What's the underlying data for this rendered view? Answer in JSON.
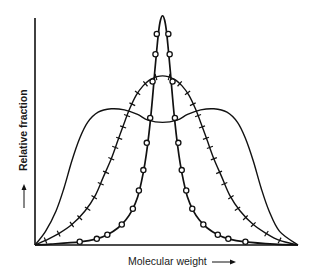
{
  "chart_data": {
    "type": "line",
    "title": "",
    "xlabel": "Molecular weight",
    "ylabel": "Relative fraction",
    "xlabel_arrow": "right-arrow",
    "ylabel_arrow": "up-arrow",
    "xlim": [
      0,
      1
    ],
    "ylim": [
      0,
      1.03
    ],
    "grid": false,
    "ticks": "none",
    "legend": "none",
    "series": [
      {
        "name": "narrow distribution",
        "marker": "circle",
        "points": [
          [
            0,
            0
          ],
          [
            0.06,
            0.004
          ],
          [
            0.17,
            0.014
          ],
          [
            0.235,
            0.027
          ],
          [
            0.275,
            0.045
          ],
          [
            0.315,
            0.075
          ],
          [
            0.345,
            0.11
          ],
          [
            0.37,
            0.155
          ],
          [
            0.39,
            0.21
          ],
          [
            0.405,
            0.28
          ],
          [
            0.418,
            0.36
          ],
          [
            0.428,
            0.44
          ],
          [
            0.438,
            0.54
          ],
          [
            0.447,
            0.65
          ],
          [
            0.455,
            0.76
          ],
          [
            0.463,
            0.86
          ],
          [
            0.47,
            0.94
          ],
          [
            0.477,
            0.99
          ],
          [
            0.485,
            1.01
          ],
          [
            0.493,
            0.99
          ],
          [
            0.5,
            0.94
          ],
          [
            0.507,
            0.86
          ],
          [
            0.515,
            0.76
          ],
          [
            0.523,
            0.65
          ],
          [
            0.532,
            0.54
          ],
          [
            0.542,
            0.44
          ],
          [
            0.552,
            0.36
          ],
          [
            0.565,
            0.28
          ],
          [
            0.58,
            0.21
          ],
          [
            0.6,
            0.155
          ],
          [
            0.625,
            0.11
          ],
          [
            0.655,
            0.075
          ],
          [
            0.695,
            0.045
          ],
          [
            0.735,
            0.027
          ],
          [
            0.8,
            0.014
          ],
          [
            0.91,
            0.004
          ],
          [
            1,
            0
          ]
        ],
        "marker_points": [
          [
            0.17,
            0.014
          ],
          [
            0.235,
            0.027
          ],
          [
            0.275,
            0.045
          ],
          [
            0.33,
            0.09
          ],
          [
            0.372,
            0.16
          ],
          [
            0.395,
            0.24
          ],
          [
            0.412,
            0.33
          ],
          [
            0.425,
            0.45
          ],
          [
            0.438,
            0.56
          ],
          [
            0.447,
            0.72
          ],
          [
            0.458,
            0.84
          ],
          [
            0.463,
            0.93
          ],
          [
            0.507,
            0.93
          ],
          [
            0.512,
            0.84
          ],
          [
            0.523,
            0.72
          ],
          [
            0.532,
            0.56
          ],
          [
            0.545,
            0.45
          ],
          [
            0.558,
            0.33
          ],
          [
            0.575,
            0.24
          ],
          [
            0.598,
            0.16
          ],
          [
            0.64,
            0.09
          ],
          [
            0.695,
            0.045
          ],
          [
            0.735,
            0.027
          ],
          [
            0.8,
            0.014
          ]
        ]
      },
      {
        "name": "intermediate distribution",
        "marker": "cross-tick",
        "points": [
          [
            0,
            0
          ],
          [
            0.04,
            0.02
          ],
          [
            0.09,
            0.05
          ],
          [
            0.14,
            0.09
          ],
          [
            0.19,
            0.15
          ],
          [
            0.23,
            0.22
          ],
          [
            0.26,
            0.3
          ],
          [
            0.29,
            0.38
          ],
          [
            0.315,
            0.46
          ],
          [
            0.34,
            0.54
          ],
          [
            0.36,
            0.6
          ],
          [
            0.385,
            0.66
          ],
          [
            0.41,
            0.7
          ],
          [
            0.44,
            0.73
          ],
          [
            0.485,
            0.745
          ],
          [
            0.53,
            0.73
          ],
          [
            0.56,
            0.7
          ],
          [
            0.585,
            0.66
          ],
          [
            0.61,
            0.6
          ],
          [
            0.63,
            0.54
          ],
          [
            0.655,
            0.46
          ],
          [
            0.68,
            0.38
          ],
          [
            0.71,
            0.3
          ],
          [
            0.74,
            0.22
          ],
          [
            0.78,
            0.15
          ],
          [
            0.83,
            0.09
          ],
          [
            0.88,
            0.05
          ],
          [
            0.93,
            0.02
          ],
          [
            1,
            0
          ]
        ],
        "marker_points": [
          [
            0.04,
            0.02
          ],
          [
            0.09,
            0.05
          ],
          [
            0.14,
            0.09
          ],
          [
            0.17,
            0.12
          ],
          [
            0.2,
            0.16
          ],
          [
            0.225,
            0.21
          ],
          [
            0.25,
            0.27
          ],
          [
            0.27,
            0.32
          ],
          [
            0.29,
            0.38
          ],
          [
            0.305,
            0.43
          ],
          [
            0.32,
            0.47
          ],
          [
            0.335,
            0.52
          ],
          [
            0.35,
            0.57
          ],
          [
            0.37,
            0.62
          ],
          [
            0.39,
            0.67
          ],
          [
            0.42,
            0.71
          ],
          [
            0.46,
            0.74
          ],
          [
            0.51,
            0.74
          ],
          [
            0.55,
            0.71
          ],
          [
            0.58,
            0.67
          ],
          [
            0.6,
            0.62
          ],
          [
            0.62,
            0.57
          ],
          [
            0.635,
            0.52
          ],
          [
            0.65,
            0.47
          ],
          [
            0.665,
            0.43
          ],
          [
            0.68,
            0.38
          ],
          [
            0.7,
            0.32
          ],
          [
            0.72,
            0.27
          ],
          [
            0.745,
            0.21
          ],
          [
            0.77,
            0.16
          ],
          [
            0.8,
            0.12
          ],
          [
            0.83,
            0.09
          ],
          [
            0.88,
            0.05
          ],
          [
            0.93,
            0.02
          ]
        ]
      },
      {
        "name": "broad bimodal distribution",
        "marker": "none",
        "points": [
          [
            0,
            0
          ],
          [
            0.04,
            0.06
          ],
          [
            0.08,
            0.15
          ],
          [
            0.11,
            0.25
          ],
          [
            0.14,
            0.37
          ],
          [
            0.17,
            0.47
          ],
          [
            0.2,
            0.54
          ],
          [
            0.24,
            0.585
          ],
          [
            0.29,
            0.6
          ],
          [
            0.34,
            0.595
          ],
          [
            0.39,
            0.575
          ],
          [
            0.43,
            0.55
          ],
          [
            0.485,
            0.54
          ],
          [
            0.54,
            0.55
          ],
          [
            0.58,
            0.575
          ],
          [
            0.63,
            0.595
          ],
          [
            0.68,
            0.6
          ],
          [
            0.73,
            0.585
          ],
          [
            0.77,
            0.54
          ],
          [
            0.8,
            0.47
          ],
          [
            0.83,
            0.37
          ],
          [
            0.86,
            0.25
          ],
          [
            0.89,
            0.15
          ],
          [
            0.93,
            0.06
          ],
          [
            1,
            0
          ]
        ]
      }
    ]
  }
}
